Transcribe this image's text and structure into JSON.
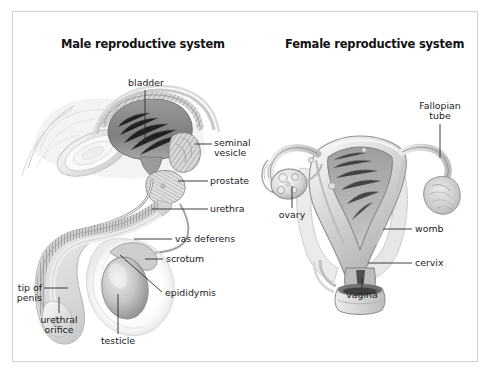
{
  "figure": {
    "background_color": "#ffffff",
    "frame_color": "#d2d2d2",
    "leader_color": "#2a2a2a",
    "ink_color": "#1b1b1b"
  },
  "panels": {
    "male": {
      "title": "Male reproductive system",
      "labels": {
        "bladder": "bladder",
        "seminal_vesicle_line1": "seminal",
        "seminal_vesicle_line2": "vesicle",
        "prostate": "prostate",
        "urethra": "urethra",
        "vas_deferens": "vas deferens",
        "scrotum": "scrotum",
        "epididymis": "epididymis",
        "tip_of_penis_line1": "tip of",
        "tip_of_penis_line2": "penis",
        "urethral_orifice_line1": "urethral",
        "urethral_orifice_line2": "orifice",
        "testicle": "testicle"
      }
    },
    "female": {
      "title": "Female reproductive system",
      "labels": {
        "fallopian_tube_line1": "Fallopian",
        "fallopian_tube_line2": "tube",
        "ovary": "ovary",
        "womb": "womb",
        "cervix": "cervix",
        "vagina": "vagina"
      }
    }
  }
}
